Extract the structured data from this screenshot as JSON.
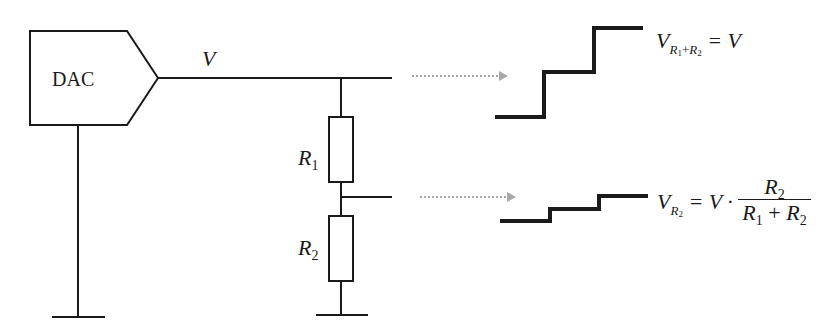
{
  "diagram": {
    "dac_label": "DAC",
    "wire_label": "V",
    "resistors": [
      {
        "name": "R",
        "sub": "1"
      },
      {
        "name": "R",
        "sub": "2"
      }
    ],
    "equation_top": {
      "lhs_var": "V",
      "lhs_sub_a": "R",
      "lhs_sub_a_idx": "1",
      "lhs_plus": "+",
      "lhs_sub_b": "R",
      "lhs_sub_b_idx": "2",
      "eq": "= V"
    },
    "equation_bottom": {
      "lhs_var": "V",
      "lhs_sub": "R",
      "lhs_sub_idx": "2",
      "eq": "= V ·",
      "num_var": "R",
      "num_idx": "2",
      "den_a": "R",
      "den_a_idx": "1",
      "den_plus": "+",
      "den_b": "R",
      "den_b_idx": "2"
    },
    "colors": {
      "line": "#1a1a1a",
      "arrow": "#a8a8a8"
    }
  }
}
